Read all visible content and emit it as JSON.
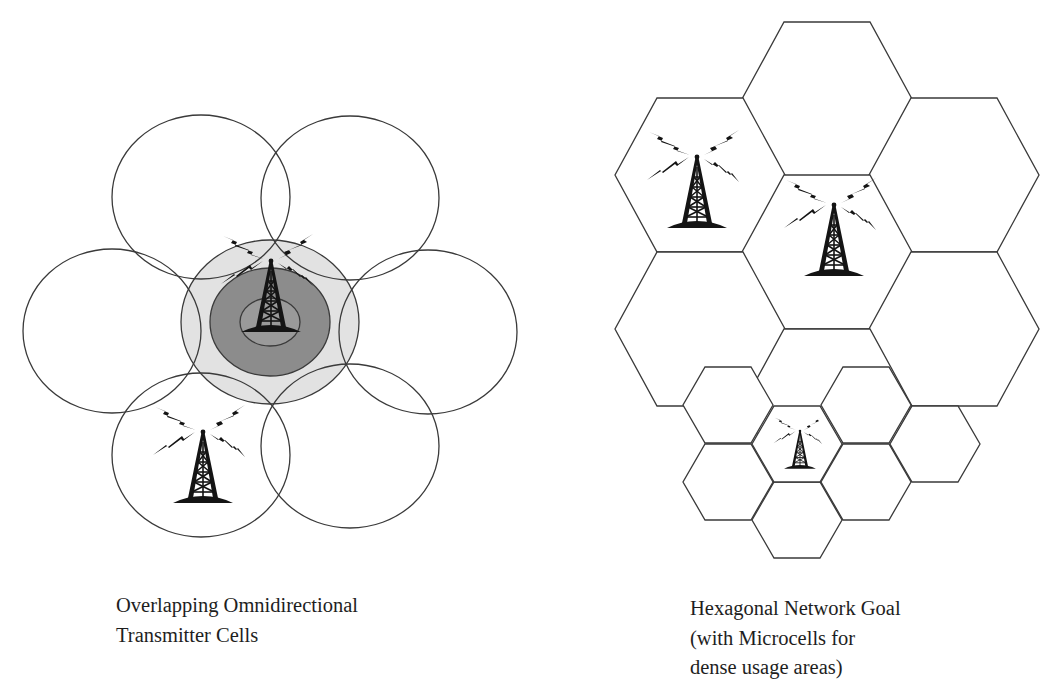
{
  "left_panel": {
    "title": "Overlapping Omnidirectional Transmitter Cells",
    "caption_lines": [
      "Overlapping Omnidirectional",
      "Transmitter Cells"
    ],
    "colors": {
      "stroke": "#3a3a3a",
      "outer_coverage_fill": "#e2e2e2",
      "inner_coverage_fill": "#8c8c8c",
      "core_fill": "#9a9a9a"
    },
    "circles": [
      {
        "name": "circle-top-left",
        "cx": 201,
        "cy": 197,
        "rx": 89,
        "ry": 82
      },
      {
        "name": "circle-top-right",
        "cx": 350,
        "cy": 198,
        "rx": 89,
        "ry": 82
      },
      {
        "name": "circle-left",
        "cx": 112,
        "cy": 331,
        "rx": 89,
        "ry": 82
      },
      {
        "name": "circle-right",
        "cx": 428,
        "cy": 332,
        "rx": 89,
        "ry": 82
      },
      {
        "name": "circle-bottom-left",
        "cx": 201,
        "cy": 455,
        "rx": 89,
        "ry": 82
      },
      {
        "name": "circle-bottom-right",
        "cx": 350,
        "cy": 446,
        "rx": 89,
        "ry": 82
      }
    ],
    "center_cell": {
      "cx": 270,
      "cy": 322,
      "outer": {
        "rx": 89,
        "ry": 82
      },
      "inner": {
        "rx": 60,
        "ry": 54
      },
      "core": {
        "rx": 30,
        "ry": 24
      }
    },
    "towers": [
      {
        "name": "tower-center",
        "x": 271,
        "y": 261,
        "scale": 1.0
      },
      {
        "name": "tower-bottom-left",
        "x": 203,
        "y": 432,
        "scale": 1.0
      }
    ]
  },
  "right_panel": {
    "title": "Hexagonal Network Goal",
    "caption_lines": [
      "Hexagonal Network Goal",
      "(with Microcells for",
      "dense usage areas)"
    ],
    "macro_hex": {
      "half_width": 85,
      "half_top": 43,
      "half_height": 77
    },
    "micro_hex": {
      "half_width": 45,
      "half_top": 23,
      "half_height": 38
    },
    "macrocells": [
      {
        "name": "hex-top",
        "cx": 827,
        "cy": 99
      },
      {
        "name": "hex-upper-left",
        "cx": 700,
        "cy": 175
      },
      {
        "name": "hex-upper-right",
        "cx": 954,
        "cy": 175
      },
      {
        "name": "hex-center",
        "cx": 827,
        "cy": 252
      },
      {
        "name": "hex-lower-left",
        "cx": 700,
        "cy": 329
      },
      {
        "name": "hex-lower-right",
        "cx": 954,
        "cy": 329
      },
      {
        "name": "hex-bottom",
        "cx": 827,
        "cy": 406
      }
    ],
    "microcells": [
      {
        "name": "microcell-upper-left",
        "cx": 728,
        "cy": 405
      },
      {
        "name": "microcell-upper-right",
        "cx": 866,
        "cy": 405
      },
      {
        "name": "microcell-lower-left",
        "cx": 728,
        "cy": 482
      },
      {
        "name": "microcell-lower-right",
        "cx": 866,
        "cy": 482
      },
      {
        "name": "microcell-bottom",
        "cx": 797,
        "cy": 520
      },
      {
        "name": "microcell-far-right",
        "cx": 935,
        "cy": 444
      },
      {
        "name": "microcell-center",
        "cx": 797,
        "cy": 444
      }
    ],
    "towers": [
      {
        "name": "tower-hex-upper-left",
        "x": 697,
        "y": 157,
        "scale": 1.0
      },
      {
        "name": "tower-hex-center",
        "x": 834,
        "y": 205,
        "scale": 1.0
      },
      {
        "name": "tower-microcell-center",
        "x": 800,
        "y": 431,
        "scale": 0.53
      }
    ]
  }
}
